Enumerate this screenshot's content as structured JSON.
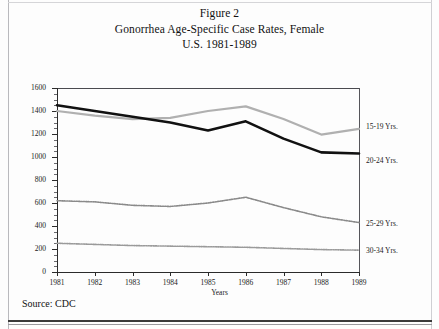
{
  "figure": {
    "title_lines": [
      "Figure 2",
      "Gonorrhea Age-Specific Case Rates, Female",
      "U.S. 1981-1989"
    ],
    "source": "Source: CDC"
  },
  "chart_data": {
    "type": "line",
    "title": "Gonorrhea Age-Specific Case Rates, Female U.S. 1981-1989",
    "xlabel": "Years",
    "ylabel": "Age-Specific Case Rates",
    "categories": [
      "1981",
      "1982",
      "1983",
      "1984",
      "1985",
      "1986",
      "1987",
      "1988",
      "1989"
    ],
    "x": [
      1981,
      1982,
      1983,
      1984,
      1985,
      1986,
      1987,
      1988,
      1989
    ],
    "xlim": [
      1981,
      1989
    ],
    "ylim": [
      0,
      1600
    ],
    "yticks": [
      0,
      200,
      400,
      600,
      800,
      1000,
      1200,
      1400,
      1600
    ],
    "ytick_labels": [
      "0",
      "200",
      "400",
      "600",
      "800",
      "1000",
      "1200",
      "1400",
      "1600"
    ],
    "grid": false,
    "legend_position": "right",
    "series": [
      {
        "name": "15-19 Yrs.",
        "color": "#b0b0b0",
        "style": "solid",
        "values": [
          1400,
          1360,
          1330,
          1340,
          1400,
          1440,
          1330,
          1195,
          1245
        ]
      },
      {
        "name": "20-24 Yrs.",
        "color": "#111111",
        "style": "solid",
        "values": [
          1450,
          1400,
          1350,
          1300,
          1230,
          1310,
          1160,
          1040,
          1030
        ]
      },
      {
        "name": "25-29 Yrs.",
        "color": "#8a8a8a",
        "style": "dotted",
        "values": [
          620,
          610,
          580,
          570,
          600,
          650,
          560,
          480,
          430
        ]
      },
      {
        "name": "30-34 Yrs.",
        "color": "#9a9a9a",
        "style": "dotted",
        "values": [
          250,
          240,
          230,
          225,
          220,
          215,
          205,
          195,
          190
        ]
      }
    ]
  }
}
